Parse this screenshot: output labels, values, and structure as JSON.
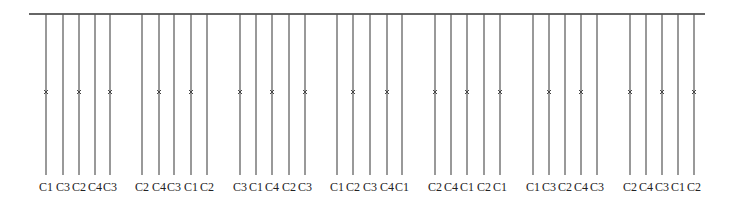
{
  "diagram": {
    "bus": {
      "x1": 29,
      "x2": 705,
      "y": 14,
      "color": "#333333"
    },
    "line_top": 14,
    "line_bottom": 175,
    "mark_y": 92,
    "label_y": 191,
    "line_color": "#555555",
    "groups": [
      {
        "xs": [
          46,
          63,
          79,
          95,
          110
        ],
        "labels": [
          "C1",
          "C3",
          "C2",
          "C4",
          "C3"
        ],
        "marks": [
          0,
          2,
          4
        ]
      },
      {
        "xs": [
          142,
          159,
          174,
          191,
          207
        ],
        "labels": [
          "C2",
          "C4",
          "C3",
          "C1",
          "C2"
        ],
        "marks": [
          1,
          3
        ]
      },
      {
        "xs": [
          240,
          256,
          272,
          289,
          305
        ],
        "labels": [
          "C3",
          "C1",
          "C4",
          "C2",
          "C3"
        ],
        "marks": [
          0,
          2,
          4
        ]
      },
      {
        "xs": [
          337,
          353,
          370,
          387,
          402
        ],
        "labels": [
          "C1",
          "C2",
          "C3",
          "C4",
          "C1"
        ],
        "marks": [
          1,
          3
        ]
      },
      {
        "xs": [
          435,
          451,
          467,
          484,
          500
        ],
        "labels": [
          "C2",
          "C4",
          "C1",
          "C2",
          "C1"
        ],
        "marks": [
          0,
          2,
          4
        ]
      },
      {
        "xs": [
          533,
          549,
          565,
          581,
          597
        ],
        "labels": [
          "C1",
          "C3",
          "C2",
          "C4",
          "C3"
        ],
        "marks": [
          1,
          3
        ]
      },
      {
        "xs": [
          630,
          646,
          662,
          678,
          694
        ],
        "labels": [
          "C2",
          "C4",
          "C3",
          "C1",
          "C2"
        ],
        "marks": [
          0,
          2,
          4
        ]
      }
    ]
  }
}
